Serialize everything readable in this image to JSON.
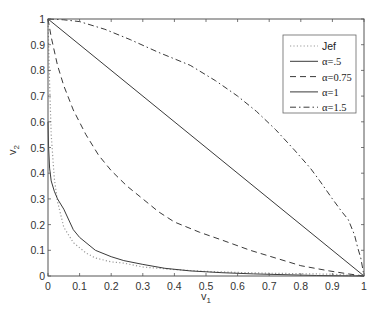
{
  "chart_data": {
    "type": "line",
    "title": "",
    "xlabel": "v",
    "xlabel_sub": "1",
    "ylabel": "v",
    "ylabel_sub": "2",
    "xlim": [
      0,
      1
    ],
    "ylim": [
      0,
      1
    ],
    "grid": false,
    "legend_position": "upper right",
    "xticks": [
      "0",
      "0.1",
      "0.2",
      "0.3",
      "0.4",
      "0.5",
      "0.6",
      "0.7",
      "0.8",
      "0.9",
      "1"
    ],
    "yticks": [
      "0",
      "0.1",
      "0.2",
      "0.3",
      "0.4",
      "0.5",
      "0.6",
      "0.7",
      "0.8",
      "0.9",
      "1"
    ],
    "series": [
      {
        "name": "Jef",
        "style": "dotted",
        "color": "#9a9a9a",
        "x": [
          0.0,
          0.005,
          0.01,
          0.02,
          0.03,
          0.05,
          0.08,
          0.12,
          0.15,
          0.2,
          0.24,
          0.3,
          0.4,
          0.5,
          0.6,
          0.7,
          0.8,
          0.9,
          1.0
        ],
        "y": [
          1.0,
          0.75,
          0.55,
          0.38,
          0.29,
          0.19,
          0.13,
          0.09,
          0.07,
          0.055,
          0.05,
          0.035,
          0.025,
          0.018,
          0.014,
          0.011,
          0.009,
          0.007,
          0.0
        ]
      },
      {
        "name": "α=.5",
        "style": "solid",
        "color": "#3a3a3a",
        "x": [
          0.0,
          0.002,
          0.005,
          0.01,
          0.02,
          0.03,
          0.05,
          0.08,
          0.1,
          0.15,
          0.2,
          0.24,
          0.3,
          0.37,
          0.45,
          0.55,
          0.65,
          0.75,
          0.85,
          0.95,
          1.0
        ],
        "y": [
          0.6,
          0.5,
          0.42,
          0.37,
          0.33,
          0.3,
          0.26,
          0.18,
          0.15,
          0.1,
          0.075,
          0.06,
          0.045,
          0.03,
          0.02,
          0.013,
          0.008,
          0.005,
          0.002,
          0.0005,
          0.0
        ]
      },
      {
        "name": "α=0.75",
        "style": "dashed",
        "color": "#3a3a3a",
        "x": [
          0.0,
          0.01,
          0.03,
          0.05,
          0.08,
          0.12,
          0.16,
          0.2,
          0.25,
          0.3,
          0.35,
          0.4,
          0.48,
          0.55,
          0.64,
          0.72,
          0.8,
          0.89,
          0.95,
          1.0
        ],
        "y": [
          1.0,
          0.93,
          0.82,
          0.74,
          0.646,
          0.55,
          0.47,
          0.41,
          0.35,
          0.3,
          0.25,
          0.21,
          0.17,
          0.14,
          0.1,
          0.07,
          0.04,
          0.02,
          0.008,
          0.0
        ]
      },
      {
        "name": "α=1",
        "style": "solid",
        "color": "#3a3a3a",
        "x": [
          0.0,
          1.0
        ],
        "y": [
          1.0,
          0.0
        ]
      },
      {
        "name": "α=1.5",
        "style": "dashdot",
        "color": "#3a3a3a",
        "x": [
          0.0,
          0.05,
          0.1,
          0.18,
          0.26,
          0.35,
          0.45,
          0.53,
          0.6,
          0.66,
          0.72,
          0.78,
          0.83,
          0.86,
          0.9,
          0.93,
          0.95,
          0.97,
          0.98,
          0.99,
          1.0
        ],
        "y": [
          1.0,
          0.997,
          0.99,
          0.96,
          0.92,
          0.87,
          0.82,
          0.76,
          0.7,
          0.64,
          0.57,
          0.49,
          0.42,
          0.37,
          0.3,
          0.25,
          0.22,
          0.16,
          0.11,
          0.07,
          0.0
        ]
      }
    ]
  },
  "legend": {
    "entries": [
      {
        "label": "Jef",
        "style": "dotted"
      },
      {
        "label": "α=.5",
        "style": "solid"
      },
      {
        "label": "α=0.75",
        "style": "dashed"
      },
      {
        "label": "α=1",
        "style": "solid"
      },
      {
        "label": "α=1.5",
        "style": "dashdot"
      }
    ]
  }
}
